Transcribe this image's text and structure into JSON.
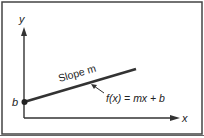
{
  "diagram": {
    "title": "",
    "axes": {
      "x_label": "x",
      "y_label": "y"
    },
    "intercept_label": "b",
    "slope_label": "Slope m",
    "equation_label": "f(x) = mx + b",
    "colors": {
      "border": "#444444",
      "line": "#333333",
      "text": "#222222",
      "background": "#ffffff"
    }
  }
}
